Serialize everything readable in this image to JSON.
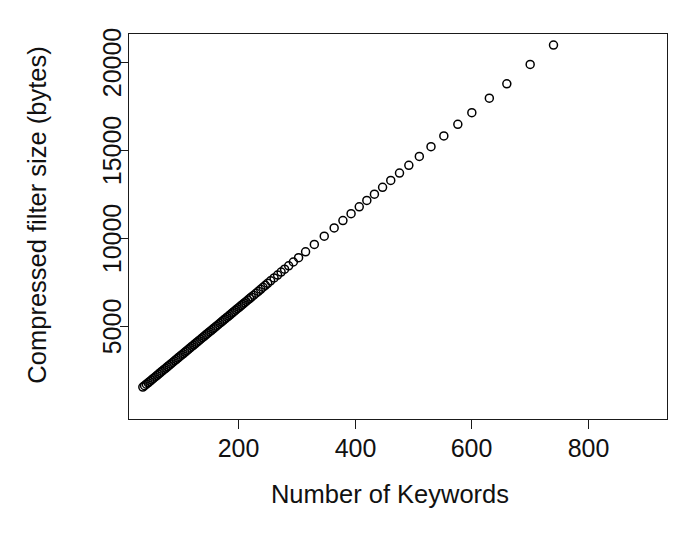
{
  "chart_data": {
    "type": "scatter",
    "title": "",
    "xlabel": "Number of Keywords",
    "ylabel": "Compressed filter size (bytes)",
    "xlim": [
      28,
      935
    ],
    "ylim": [
      1100,
      21600
    ],
    "xticks": [
      200,
      400,
      600,
      800
    ],
    "xtick_labels": [
      "200",
      "400",
      "600",
      "800"
    ],
    "yticks": [
      5000,
      10000,
      15000,
      20000
    ],
    "ytick_labels": [
      "5000",
      "10000",
      "15000",
      "20000"
    ],
    "grid": false,
    "legend": null,
    "marker": "open-circle",
    "marker_color": "#000000",
    "marker_size": 8,
    "points": [
      [
        36,
        1560
      ],
      [
        38,
        1605
      ],
      [
        39,
        1640
      ],
      [
        41,
        1690
      ],
      [
        42,
        1720
      ],
      [
        44,
        1775
      ],
      [
        45,
        1800
      ],
      [
        47,
        1855
      ],
      [
        48,
        1880
      ],
      [
        50,
        1935
      ],
      [
        51,
        1965
      ],
      [
        53,
        2015
      ],
      [
        54,
        2050
      ],
      [
        56,
        2100
      ],
      [
        57,
        2130
      ],
      [
        59,
        2185
      ],
      [
        60,
        2215
      ],
      [
        62,
        2265
      ],
      [
        63,
        2295
      ],
      [
        65,
        2350
      ],
      [
        66,
        2380
      ],
      [
        68,
        2430
      ],
      [
        69,
        2460
      ],
      [
        71,
        2515
      ],
      [
        72,
        2545
      ],
      [
        74,
        2595
      ],
      [
        75,
        2625
      ],
      [
        77,
        2680
      ],
      [
        78,
        2710
      ],
      [
        80,
        2760
      ],
      [
        81,
        2790
      ],
      [
        83,
        2845
      ],
      [
        84,
        2875
      ],
      [
        86,
        2925
      ],
      [
        87,
        2955
      ],
      [
        89,
        3010
      ],
      [
        90,
        3040
      ],
      [
        92,
        3090
      ],
      [
        93,
        3120
      ],
      [
        95,
        3175
      ],
      [
        96,
        3205
      ],
      [
        98,
        3255
      ],
      [
        99,
        3285
      ],
      [
        101,
        3340
      ],
      [
        102,
        3370
      ],
      [
        104,
        3420
      ],
      [
        105,
        3450
      ],
      [
        107,
        3505
      ],
      [
        108,
        3535
      ],
      [
        110,
        3585
      ],
      [
        111,
        3615
      ],
      [
        113,
        3670
      ],
      [
        114,
        3700
      ],
      [
        116,
        3750
      ],
      [
        117,
        3780
      ],
      [
        119,
        3835
      ],
      [
        120,
        3865
      ],
      [
        122,
        3915
      ],
      [
        123,
        3945
      ],
      [
        125,
        4000
      ],
      [
        126,
        4030
      ],
      [
        128,
        4080
      ],
      [
        129,
        4110
      ],
      [
        131,
        4165
      ],
      [
        132,
        4195
      ],
      [
        134,
        4245
      ],
      [
        135,
        4275
      ],
      [
        137,
        4330
      ],
      [
        138,
        4360
      ],
      [
        140,
        4410
      ],
      [
        141,
        4440
      ],
      [
        143,
        4495
      ],
      [
        144,
        4525
      ],
      [
        146,
        4575
      ],
      [
        147,
        4605
      ],
      [
        149,
        4660
      ],
      [
        150,
        4690
      ],
      [
        152,
        4740
      ],
      [
        153,
        4770
      ],
      [
        155,
        4825
      ],
      [
        156,
        4855
      ],
      [
        158,
        4905
      ],
      [
        159,
        4935
      ],
      [
        161,
        4990
      ],
      [
        162,
        5020
      ],
      [
        164,
        5070
      ],
      [
        165,
        5100
      ],
      [
        167,
        5155
      ],
      [
        168,
        5185
      ],
      [
        170,
        5235
      ],
      [
        171,
        5265
      ],
      [
        173,
        5320
      ],
      [
        174,
        5350
      ],
      [
        176,
        5400
      ],
      [
        177,
        5430
      ],
      [
        179,
        5485
      ],
      [
        180,
        5515
      ],
      [
        182,
        5565
      ],
      [
        183,
        5595
      ],
      [
        185,
        5650
      ],
      [
        186,
        5680
      ],
      [
        188,
        5730
      ],
      [
        189,
        5760
      ],
      [
        191,
        5815
      ],
      [
        192,
        5845
      ],
      [
        194,
        5895
      ],
      [
        195,
        5925
      ],
      [
        197,
        5980
      ],
      [
        198,
        6010
      ],
      [
        200,
        6060
      ],
      [
        201,
        6090
      ],
      [
        203,
        6145
      ],
      [
        204,
        6175
      ],
      [
        206,
        6225
      ],
      [
        207,
        6255
      ],
      [
        209,
        6310
      ],
      [
        210,
        6340
      ],
      [
        212,
        6390
      ],
      [
        213,
        6420
      ],
      [
        215,
        6475
      ],
      [
        216,
        6505
      ],
      [
        218,
        6555
      ],
      [
        219,
        6585
      ],
      [
        221,
        6640
      ],
      [
        222,
        6670
      ],
      [
        224,
        6720
      ],
      [
        226,
        6775
      ],
      [
        228,
        6830
      ],
      [
        230,
        6890
      ],
      [
        232,
        6945
      ],
      [
        234,
        7000
      ],
      [
        236,
        7060
      ],
      [
        238,
        7115
      ],
      [
        240,
        7170
      ],
      [
        242,
        7230
      ],
      [
        244,
        7285
      ],
      [
        246,
        7340
      ],
      [
        248,
        7400
      ],
      [
        250,
        7455
      ],
      [
        252,
        7510
      ],
      [
        255,
        7595
      ],
      [
        258,
        7675
      ],
      [
        261,
        7760
      ],
      [
        264,
        7840
      ],
      [
        267,
        7925
      ],
      [
        270,
        8005
      ],
      [
        273,
        8090
      ],
      [
        276,
        8170
      ],
      [
        279,
        8255
      ],
      [
        282,
        8335
      ],
      [
        286,
        8445
      ],
      [
        290,
        8555
      ],
      [
        294,
        8665
      ],
      [
        298,
        8775
      ],
      [
        303,
        8910
      ],
      [
        308,
        9050
      ],
      [
        315,
        9245
      ],
      [
        322,
        9440
      ],
      [
        330,
        9660
      ],
      [
        338,
        9880
      ],
      [
        347,
        10130
      ],
      [
        356,
        10380
      ],
      [
        364,
        10600
      ],
      [
        372,
        10825
      ],
      [
        379,
        11020
      ],
      [
        386,
        11215
      ],
      [
        393,
        11410
      ],
      [
        400,
        11605
      ],
      [
        407,
        11800
      ],
      [
        414,
        11995
      ],
      [
        420,
        12160
      ],
      [
        426,
        12330
      ],
      [
        433,
        12520
      ],
      [
        440,
        12715
      ],
      [
        447,
        12910
      ],
      [
        454,
        13105
      ],
      [
        461,
        13300
      ],
      [
        468,
        13500
      ],
      [
        476,
        13720
      ],
      [
        484,
        13940
      ],
      [
        492,
        14160
      ],
      [
        500,
        14380
      ],
      [
        510,
        14660
      ],
      [
        520,
        14940
      ],
      [
        530,
        15220
      ],
      [
        540,
        15500
      ],
      [
        552,
        15830
      ],
      [
        564,
        16160
      ],
      [
        576,
        16490
      ],
      [
        588,
        16820
      ],
      [
        600,
        17150
      ],
      [
        615,
        17560
      ],
      [
        630,
        17970
      ],
      [
        645,
        18380
      ],
      [
        660,
        18790
      ],
      [
        680,
        19340
      ],
      [
        700,
        19890
      ],
      [
        720,
        20440
      ],
      [
        740,
        20990
      ],
      [
        900,
        25360
      ]
    ],
    "visual_points": [
      [
        36,
        1560
      ],
      [
        39,
        1640
      ],
      [
        42,
        1720
      ],
      [
        45,
        1800
      ],
      [
        48,
        1880
      ],
      [
        51,
        1965
      ],
      [
        54,
        2050
      ],
      [
        57,
        2130
      ],
      [
        60,
        2215
      ],
      [
        63,
        2295
      ],
      [
        66,
        2380
      ],
      [
        69,
        2460
      ],
      [
        72,
        2545
      ],
      [
        75,
        2625
      ],
      [
        78,
        2710
      ],
      [
        81,
        2790
      ],
      [
        84,
        2875
      ],
      [
        87,
        2955
      ],
      [
        90,
        3040
      ],
      [
        93,
        3120
      ],
      [
        96,
        3205
      ],
      [
        99,
        3285
      ],
      [
        102,
        3370
      ],
      [
        105,
        3450
      ],
      [
        108,
        3535
      ],
      [
        111,
        3615
      ],
      [
        114,
        3700
      ],
      [
        117,
        3780
      ],
      [
        120,
        3865
      ],
      [
        123,
        3945
      ],
      [
        126,
        4030
      ],
      [
        129,
        4110
      ],
      [
        132,
        4195
      ],
      [
        135,
        4275
      ],
      [
        138,
        4360
      ],
      [
        141,
        4440
      ],
      [
        144,
        4525
      ],
      [
        147,
        4605
      ],
      [
        150,
        4690
      ],
      [
        153,
        4770
      ],
      [
        156,
        4855
      ],
      [
        159,
        4935
      ],
      [
        162,
        5020
      ],
      [
        165,
        5100
      ],
      [
        168,
        5185
      ],
      [
        171,
        5265
      ],
      [
        174,
        5350
      ],
      [
        177,
        5430
      ],
      [
        180,
        5515
      ],
      [
        183,
        5595
      ],
      [
        186,
        5680
      ],
      [
        189,
        5760
      ],
      [
        192,
        5845
      ],
      [
        195,
        5925
      ],
      [
        198,
        6010
      ],
      [
        201,
        6090
      ],
      [
        204,
        6175
      ],
      [
        207,
        6255
      ],
      [
        210,
        6340
      ],
      [
        213,
        6420
      ],
      [
        216,
        6505
      ],
      [
        219,
        6585
      ],
      [
        222,
        6670
      ],
      [
        226,
        6775
      ],
      [
        230,
        6890
      ],
      [
        234,
        7000
      ],
      [
        238,
        7115
      ],
      [
        242,
        7230
      ],
      [
        246,
        7340
      ],
      [
        250,
        7455
      ],
      [
        255,
        7595
      ],
      [
        261,
        7760
      ],
      [
        267,
        7925
      ],
      [
        273,
        8090
      ],
      [
        279,
        8255
      ],
      [
        286,
        8445
      ],
      [
        294,
        8665
      ],
      [
        303,
        8910
      ],
      [
        315,
        9245
      ],
      [
        330,
        9660
      ],
      [
        347,
        10130
      ],
      [
        364,
        10600
      ],
      [
        379,
        11020
      ],
      [
        393,
        11410
      ],
      [
        407,
        11800
      ],
      [
        420,
        12160
      ],
      [
        433,
        12520
      ],
      [
        447,
        12910
      ],
      [
        461,
        13300
      ],
      [
        476,
        13720
      ],
      [
        492,
        14160
      ],
      [
        510,
        14660
      ],
      [
        530,
        15220
      ],
      [
        552,
        15830
      ],
      [
        576,
        16490
      ],
      [
        600,
        17150
      ],
      [
        630,
        17970
      ],
      [
        660,
        18790
      ],
      [
        700,
        19890
      ],
      [
        740,
        20990
      ],
      [
        900,
        25360
      ]
    ]
  },
  "axes": {
    "x_title": "Number of Keywords",
    "y_title": "Compressed filter size (bytes)",
    "x_tick_0": "200",
    "x_tick_1": "400",
    "x_tick_2": "600",
    "x_tick_3": "800",
    "y_tick_0": "5000",
    "y_tick_1": "10000",
    "y_tick_2": "15000",
    "y_tick_3": "20000"
  },
  "style": {
    "frame_color": "#1a1a1a",
    "marker_stroke": "#000000",
    "background": "#ffffff"
  }
}
